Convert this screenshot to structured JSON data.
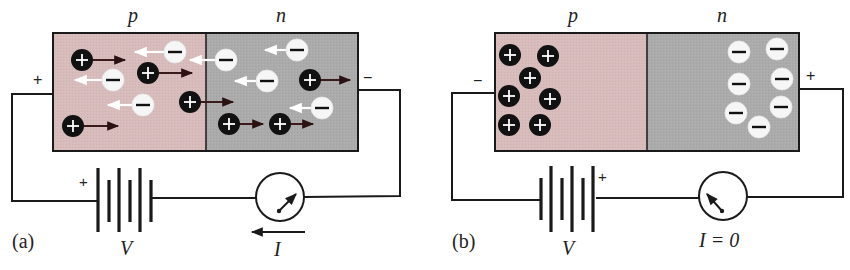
{
  "colors": {
    "p_region": "#d8bcbc",
    "n_region": "#ababab",
    "hole_fill": "#111111",
    "electron_fill": "#f6f6f6",
    "wire": "#1a1a1a",
    "hole_arrow": "#3a1a1a",
    "electron_arrow": "#ffffff"
  },
  "top_caption_fragment": "",
  "panel_a": {
    "label": "(a)",
    "p_label": "p",
    "n_label": "n",
    "left_terminal_sign": "+",
    "right_terminal_sign": "−",
    "battery_plus_sign": "+",
    "battery_label": "V",
    "current_label": "I",
    "bias": "forward",
    "holes": [
      {
        "x": 82,
        "y": 60,
        "arrow_to": 125
      },
      {
        "x": 148,
        "y": 73,
        "arrow_to": 192
      },
      {
        "x": 190,
        "y": 102,
        "arrow_to": 233
      },
      {
        "x": 73,
        "y": 126,
        "arrow_to": 118
      },
      {
        "x": 310,
        "y": 80,
        "arrow_to": 350
      },
      {
        "x": 229,
        "y": 124,
        "arrow_to": 263
      },
      {
        "x": 280,
        "y": 124,
        "arrow_to": 313
      }
    ],
    "electrons": [
      {
        "x": 175,
        "y": 52,
        "arrow_to": 135
      },
      {
        "x": 113,
        "y": 80,
        "arrow_to": 75
      },
      {
        "x": 143,
        "y": 105,
        "arrow_to": 108
      },
      {
        "x": 226,
        "y": 60,
        "arrow_to": 190
      },
      {
        "x": 297,
        "y": 50,
        "arrow_to": 265
      },
      {
        "x": 267,
        "y": 81,
        "arrow_to": 235
      },
      {
        "x": 322,
        "y": 108,
        "arrow_to": 290
      }
    ]
  },
  "panel_b": {
    "label": "(b)",
    "p_label": "p",
    "n_label": "n",
    "left_terminal_sign": "−",
    "right_terminal_sign": "+",
    "battery_plus_sign": "+",
    "battery_label": "V",
    "current_label": "I = 0",
    "bias": "reverse",
    "holes": [
      {
        "x": 510,
        "y": 55
      },
      {
        "x": 548,
        "y": 56
      },
      {
        "x": 530,
        "y": 78
      },
      {
        "x": 509,
        "y": 96
      },
      {
        "x": 550,
        "y": 99
      },
      {
        "x": 509,
        "y": 125
      },
      {
        "x": 540,
        "y": 125
      }
    ],
    "electrons": [
      {
        "x": 739,
        "y": 52
      },
      {
        "x": 777,
        "y": 49
      },
      {
        "x": 739,
        "y": 84
      },
      {
        "x": 782,
        "y": 79
      },
      {
        "x": 736,
        "y": 113
      },
      {
        "x": 781,
        "y": 107
      },
      {
        "x": 759,
        "y": 127
      }
    ]
  }
}
